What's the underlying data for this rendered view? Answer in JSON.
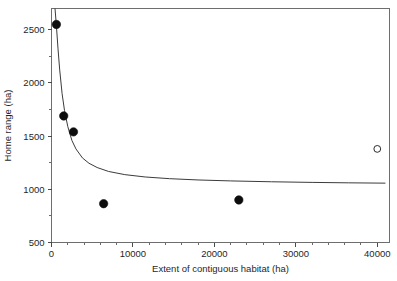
{
  "chart_data": {
    "type": "scatter",
    "title": "",
    "xlabel": "Extent of contiguous habitat (ha)",
    "ylabel": "Home range (ha)",
    "xlim": [
      0,
      41500
    ],
    "ylim": [
      500,
      2700
    ],
    "grid": false,
    "legend": null,
    "xticks": [
      0,
      10000,
      20000,
      30000,
      40000
    ],
    "xticklabels": [
      "0",
      "10000",
      "20000",
      "30000",
      "40000"
    ],
    "xminor_step": 2000,
    "yticks": [
      500,
      1000,
      1500,
      2000,
      2500
    ],
    "yticklabels": [
      "500",
      "1000",
      "1500",
      "2000",
      "2500"
    ],
    "yminor_step": 250,
    "series": [
      {
        "name": "observed",
        "marker": "filled-circle",
        "color": "#0d0d0d",
        "points": [
          {
            "x": 600,
            "y": 2550
          },
          {
            "x": 1500,
            "y": 1690
          },
          {
            "x": 2700,
            "y": 1540
          },
          {
            "x": 6400,
            "y": 865
          },
          {
            "x": 23000,
            "y": 900
          }
        ]
      },
      {
        "name": "excluded",
        "marker": "open-circle",
        "color": "#2b2b2b",
        "points": [
          {
            "x": 40000,
            "y": 1380
          }
        ]
      },
      {
        "name": "fitted-curve",
        "marker": "line",
        "color": "#3b3b3b",
        "points": [
          {
            "x": 430,
            "y": 2700
          },
          {
            "x": 600,
            "y": 2540
          },
          {
            "x": 800,
            "y": 2320
          },
          {
            "x": 1000,
            "y": 2130
          },
          {
            "x": 1300,
            "y": 1900
          },
          {
            "x": 1600,
            "y": 1740
          },
          {
            "x": 2000,
            "y": 1590
          },
          {
            "x": 2500,
            "y": 1460
          },
          {
            "x": 3000,
            "y": 1380
          },
          {
            "x": 3800,
            "y": 1295
          },
          {
            "x": 4600,
            "y": 1245
          },
          {
            "x": 5600,
            "y": 1205
          },
          {
            "x": 7000,
            "y": 1168
          },
          {
            "x": 9000,
            "y": 1138
          },
          {
            "x": 11500,
            "y": 1116
          },
          {
            "x": 14500,
            "y": 1100
          },
          {
            "x": 18000,
            "y": 1088
          },
          {
            "x": 22000,
            "y": 1079
          },
          {
            "x": 27000,
            "y": 1071
          },
          {
            "x": 32000,
            "y": 1065
          },
          {
            "x": 36500,
            "y": 1061
          },
          {
            "x": 41000,
            "y": 1058
          }
        ]
      }
    ]
  }
}
